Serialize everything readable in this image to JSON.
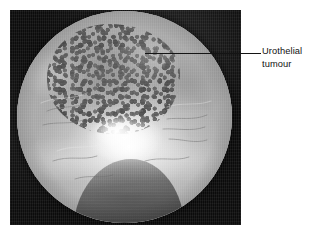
{
  "figure": {
    "kind": "endoscopic-photograph",
    "modality": "cystoscopy",
    "background_color": "#ffffff",
    "panel_color": "#0c0c0c",
    "photo": {
      "description": "Circular endoscopic (cystoscopic) view of the bladder interior in greyscale, with a bright central light reflection, a papillary urothelial tumour occupying the upper-left of the field, smooth mucosal folds around the periphery, and a dark rounded instrument silhouette entering from the bottom centre."
    }
  },
  "annotations": [
    {
      "id": "urothelial-tumour",
      "line1": "Urothelial",
      "line2": "tumour",
      "leader_color": "#141414",
      "text_color": "#111111"
    }
  ]
}
